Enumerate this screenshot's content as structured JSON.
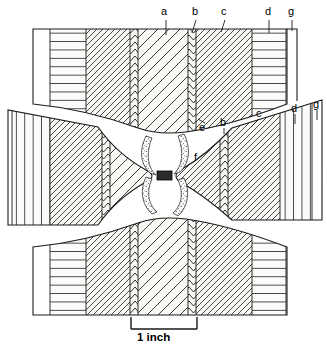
{
  "figure": {
    "scale_bar": {
      "label": "1 inch",
      "length_px": 88
    },
    "line_color": "#1a1a1a",
    "fill_light": "#f7f7f4",
    "fill_white": "#ffffff",
    "stipple_color": "#5a5a5a"
  },
  "labels": {
    "top": [
      {
        "id": "a",
        "text": "a",
        "x": 161,
        "y": 8,
        "leader_x1": 166,
        "leader_y1": 20,
        "leader_x2": 166,
        "leader_y2": 35
      },
      {
        "id": "b",
        "text": "b",
        "x": 192,
        "y": 8,
        "leader_x1": 196,
        "leader_y1": 20,
        "leader_x2": 193,
        "leader_y2": 33
      },
      {
        "id": "c",
        "text": "c",
        "x": 221,
        "y": 8,
        "leader_x1": 225,
        "leader_y1": 20,
        "leader_x2": 222,
        "leader_y2": 32
      },
      {
        "id": "d",
        "text": "d",
        "x": 265,
        "y": 8,
        "leader_x1": 269,
        "leader_y1": 20,
        "leader_x2": 269,
        "leader_y2": 33
      },
      {
        "id": "g",
        "text": "g",
        "x": 288,
        "y": 8,
        "leader_x1": 292,
        "leader_y1": 20,
        "leader_x2": 292,
        "leader_y2": 31
      }
    ],
    "middle": [
      {
        "id": "e",
        "text": "e",
        "x": 199,
        "y": 124,
        "leader_x1": 203,
        "leader_y1": 124,
        "leader_x2": 197,
        "leader_y2": 120
      },
      {
        "id": "b",
        "text": "b",
        "x": 220,
        "y": 121,
        "leader_x1": 223,
        "leader_y1": 126,
        "leader_x2": 223,
        "leader_y2": 133
      },
      {
        "id": "c",
        "text": "c",
        "x": 256,
        "y": 112,
        "leader_x1": 258,
        "leader_y1": 118,
        "leader_x2": 250,
        "leader_y2": 125
      },
      {
        "id": "d",
        "text": "d",
        "x": 291,
        "y": 108,
        "leader_x1": 294,
        "leader_y1": 114,
        "leader_x2": 294,
        "leader_y2": 123
      },
      {
        "id": "g",
        "text": "g",
        "x": 313,
        "y": 104,
        "leader_x1": 316,
        "leader_y1": 111,
        "leader_x2": 316,
        "leader_y2": 120
      },
      {
        "id": "f",
        "text": "f",
        "x": 194,
        "y": 155,
        "leader_x1": 0,
        "leader_y1": 0,
        "leader_x2": 0,
        "leader_y2": 0
      }
    ]
  },
  "regions": {
    "a": {
      "name": "core-zone-a",
      "hatch": "diagonal-sparse"
    },
    "b": {
      "name": "chevron-seam-b",
      "hatch": "chevron"
    },
    "c": {
      "name": "zone-c",
      "hatch": "diagonal-dense"
    },
    "d": {
      "name": "zone-d",
      "hatch": "horizontal-lines"
    },
    "e": {
      "name": "boundary-e",
      "hatch": "none"
    },
    "f": {
      "name": "zone-f",
      "hatch": "diagonal-dense"
    },
    "g": {
      "name": "outer-shell-g",
      "hatch": "blank"
    }
  },
  "scale": {
    "text": "1 inch"
  }
}
